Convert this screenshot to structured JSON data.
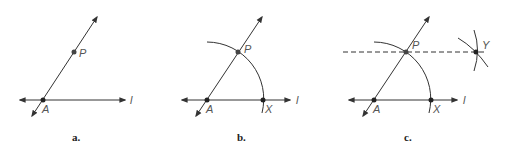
{
  "colors": {
    "line": "#333333",
    "label": "#555555",
    "caption": "#222222"
  },
  "panels": [
    {
      "caption": "a.",
      "points": {
        "A": "A",
        "P": "P"
      },
      "line_label": "l"
    },
    {
      "caption": "b.",
      "points": {
        "A": "A",
        "P": "P",
        "X": "X"
      },
      "line_label": "l"
    },
    {
      "caption": "c.",
      "points": {
        "A": "A",
        "P": "P",
        "X": "X",
        "Y": "Y"
      },
      "line_label": "l"
    }
  ]
}
